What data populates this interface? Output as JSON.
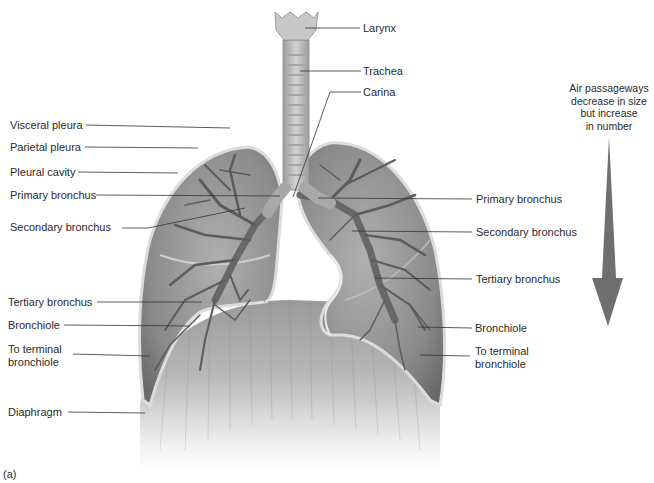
{
  "figure": {
    "panel_label": "(a)",
    "top_labels": [
      {
        "id": "larynx",
        "text": "Larynx"
      },
      {
        "id": "trachea",
        "text": "Trachea"
      },
      {
        "id": "carina",
        "text": "Carina"
      }
    ],
    "left_labels": [
      {
        "id": "visceral-pleura",
        "text": "Visceral pleura"
      },
      {
        "id": "parietal-pleura",
        "text": "Parietal pleura"
      },
      {
        "id": "pleural-cavity",
        "text": "Pleural cavity"
      },
      {
        "id": "primary-bronchus-left",
        "text": "Primary bronchus"
      },
      {
        "id": "secondary-bronchus-left",
        "text": "Secondary bronchus"
      },
      {
        "id": "tertiary-bronchus-left",
        "text": "Tertiary bronchus"
      },
      {
        "id": "bronchiole-left",
        "text": "Bronchiole"
      },
      {
        "id": "terminal-bronchiole-left",
        "text": "To terminal\nbronchiole",
        "line1": "To terminal",
        "line2": "bronchiole"
      },
      {
        "id": "diaphragm",
        "text": "Diaphragm"
      }
    ],
    "right_labels": [
      {
        "id": "primary-bronchus-right",
        "text": "Primary bronchus"
      },
      {
        "id": "secondary-bronchus-right",
        "text": "Secondary bronchus"
      },
      {
        "id": "tertiary-bronchus-right",
        "text": "Tertiary bronchus"
      },
      {
        "id": "bronchiole-right",
        "text": "Bronchiole"
      },
      {
        "id": "terminal-bronchiole-right",
        "text": "To terminal\nbronchiole",
        "line1": "To terminal",
        "line2": "bronchiole"
      }
    ],
    "arrow_note": {
      "line1": "Air passageways",
      "line2": "decrease in size",
      "line3": "but increase",
      "line4": "in number"
    },
    "colors": {
      "lung_fill": "#8f8f8f",
      "lung_dark": "#6e6e6e",
      "pleura_edge": "#d6d6d6",
      "trachea": "#bdbdbd",
      "diaphragm": "#a8a8a8",
      "arrow": "#6f6f6f",
      "leader_line": "#333333"
    }
  }
}
